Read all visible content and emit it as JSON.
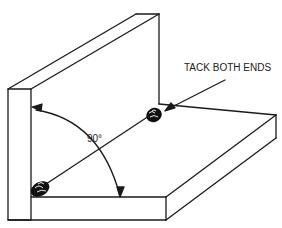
{
  "diagram": {
    "annotations": {
      "callout": "TACK BOTH ENDS",
      "angle": "90°"
    },
    "parts": [
      "vertical-plate",
      "horizontal-plate",
      "tack-weld-top",
      "tack-weld-bottom",
      "weld-joint-line",
      "angle-arc"
    ],
    "colors": {
      "line": "#1a1a1a",
      "background": "#ffffff",
      "weld_fill": "#111111"
    }
  }
}
